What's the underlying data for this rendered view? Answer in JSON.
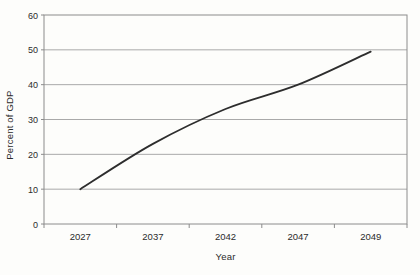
{
  "chart_data": {
    "type": "line",
    "title": "",
    "xlabel": "Year",
    "ylabel": "Percent of GDP",
    "categories": [
      "2027",
      "2037",
      "2042",
      "2047",
      "2049"
    ],
    "series": [
      {
        "name": "Percent of GDP projection",
        "values": [
          10,
          23,
          33,
          40,
          49.5
        ]
      }
    ],
    "ylim": [
      0,
      60
    ],
    "y_ticks": [
      0,
      10,
      20,
      30,
      40,
      50,
      60
    ],
    "grid": "horizontal",
    "legend_position": "none",
    "colors": {
      "line": "#2d2d2d",
      "gridline": "#a9a9a9",
      "axis": "#8c8c8c",
      "text": "#2b2b2b",
      "background": "#fdfdfb"
    }
  }
}
